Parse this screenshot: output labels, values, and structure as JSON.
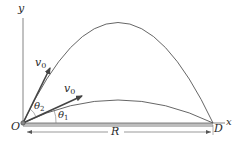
{
  "diagram": {
    "axes": {
      "y_label": "y",
      "x_label": "x",
      "origin_label": "O",
      "end_label": "D"
    },
    "vectors": [
      {
        "name": "high-angle-velocity",
        "label": "v",
        "subscript": "0",
        "angle_label": "θ",
        "angle_subscript": "2"
      },
      {
        "name": "low-angle-velocity",
        "label": "v",
        "subscript": "0",
        "angle_label": "θ",
        "angle_subscript": "1"
      }
    ],
    "range_label": "R",
    "colors": {
      "line": "#555555",
      "vector": "#444444",
      "ground": "#bdbdbd",
      "text": "#2a2a2a"
    }
  }
}
